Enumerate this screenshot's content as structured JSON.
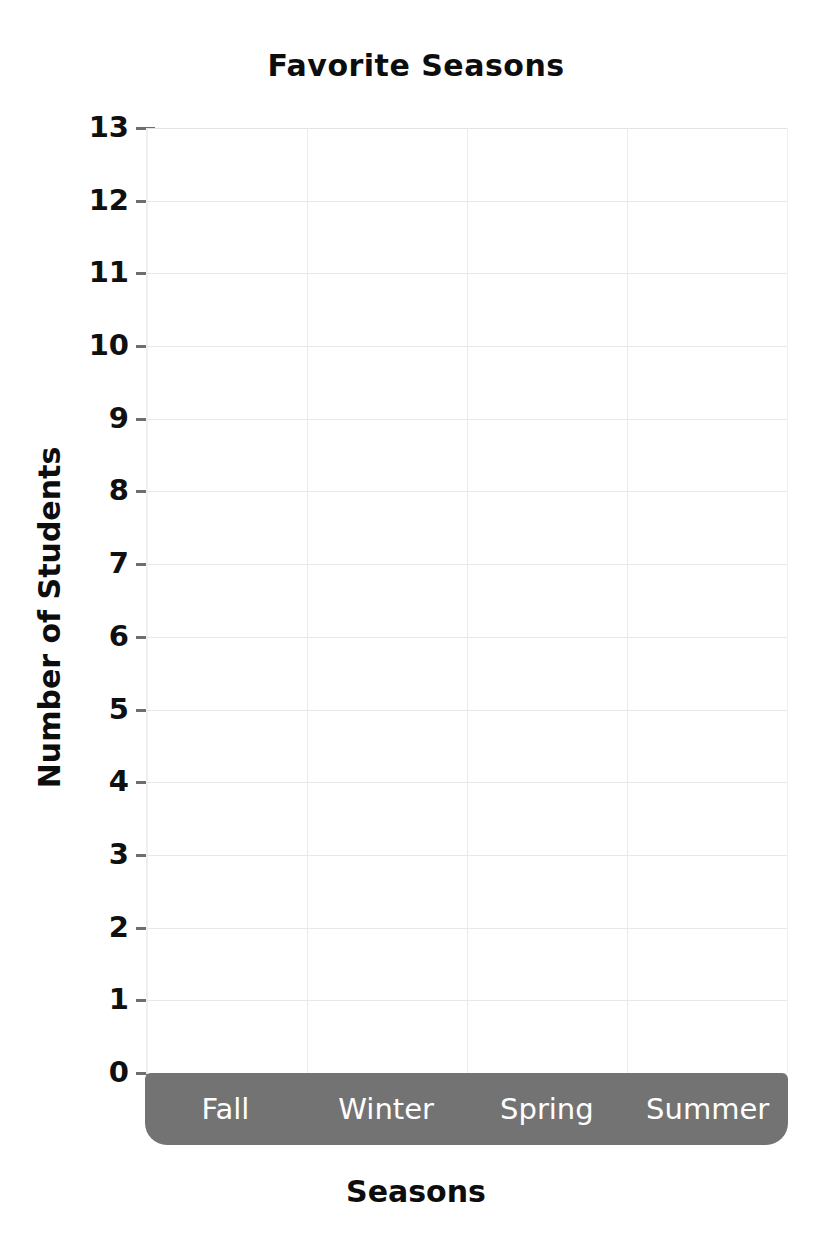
{
  "chart_data": {
    "type": "bar",
    "title": "Favorite Seasons",
    "xlabel": "Seasons",
    "ylabel": "Number of Students",
    "categories": [
      "Fall",
      "Winter",
      "Spring",
      "Summer"
    ],
    "values": [
      null,
      null,
      null,
      null
    ],
    "values_note": "blank template — no bars drawn",
    "ylim": [
      0,
      13
    ],
    "ytick_step": 1,
    "yticks": [
      0,
      1,
      2,
      3,
      4,
      5,
      6,
      7,
      8,
      9,
      10,
      11,
      12,
      13
    ],
    "ytick_labels": [
      "0",
      "1",
      "2",
      "3",
      "4",
      "5",
      "6",
      "7",
      "8",
      "9",
      "10",
      "11",
      "12",
      "13"
    ],
    "grid": true,
    "grid_horizontal": true,
    "grid_vertical": true,
    "vertical_gridline_count": 3,
    "legend": null,
    "legend_position": "none",
    "orientation": "vertical",
    "annotations": []
  },
  "colors": {
    "background": "#ffffff",
    "title_text": "#0d0d0d",
    "axis_text": "#101010",
    "gridline": "#e8e8e8",
    "gridline_vertical": "#ebebeb",
    "axis_line": "#efefef",
    "tick_mark": "#6e6e6e",
    "x_axis_band": "#737373",
    "x_axis_band_text": "#ffffff"
  },
  "labels": {
    "title": "Favorite Seasons",
    "y_axis_title": "Number of Students",
    "x_axis_title": "Seasons"
  },
  "y_ticks": [
    {
      "value": 13,
      "label": "13"
    },
    {
      "value": 12,
      "label": "12"
    },
    {
      "value": 11,
      "label": "11"
    },
    {
      "value": 10,
      "label": "10"
    },
    {
      "value": 9,
      "label": "9"
    },
    {
      "value": 8,
      "label": "8"
    },
    {
      "value": 7,
      "label": "7"
    },
    {
      "value": 6,
      "label": "6"
    },
    {
      "value": 5,
      "label": "5"
    },
    {
      "value": 4,
      "label": "4"
    },
    {
      "value": 3,
      "label": "3"
    },
    {
      "value": 2,
      "label": "2"
    },
    {
      "value": 1,
      "label": "1"
    },
    {
      "value": 0,
      "label": "0"
    }
  ],
  "x_categories": [
    {
      "label": "Fall"
    },
    {
      "label": "Winter"
    },
    {
      "label": "Spring"
    },
    {
      "label": "Summer"
    }
  ]
}
